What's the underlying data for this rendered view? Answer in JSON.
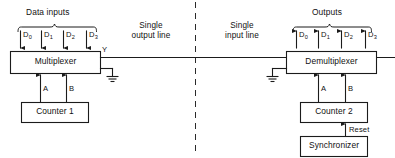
{
  "diagram": {
    "title_left": "Data inputs",
    "title_right": "Outputs",
    "divider": "dashed-vertical-separator",
    "blocks": {
      "multiplexer": "Multiplexer",
      "demultiplexer": "Demultiplexer",
      "counter1": "Counter 1",
      "counter2": "Counter 2",
      "synchronizer": "Synchronizer"
    },
    "left_pins": [
      {
        "base": "D",
        "sub": "0"
      },
      {
        "base": "D",
        "sub": "1"
      },
      {
        "base": "D",
        "sub": "2"
      },
      {
        "base": "D",
        "sub": "3"
      }
    ],
    "right_pins": [
      {
        "base": "D",
        "sub": "0"
      },
      {
        "base": "D",
        "sub": "1"
      },
      {
        "base": "D",
        "sub": "2"
      },
      {
        "base": "D",
        "sub": "3"
      }
    ],
    "mux_select_labels": [
      "A",
      "B"
    ],
    "demux_select_labels": [
      "A",
      "B"
    ],
    "output_pin": "Y",
    "notes": {
      "single_output_line_l1": "Single",
      "single_output_line_l2": "output line",
      "single_input_line_l1": "Single",
      "single_input_line_l2": "input line"
    },
    "reset_label": "Reset",
    "colors": {
      "ink": "#1b1b1b",
      "paper": "#ffffff",
      "divider": "#2a2a2a"
    }
  }
}
